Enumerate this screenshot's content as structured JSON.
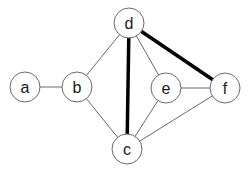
{
  "diagram": {
    "type": "undirected-graph",
    "node_radius": 15,
    "nodes": [
      {
        "id": "a",
        "label": "a",
        "x": 25,
        "y": 87
      },
      {
        "id": "b",
        "label": "b",
        "x": 77,
        "y": 87
      },
      {
        "id": "d",
        "label": "d",
        "x": 129,
        "y": 23
      },
      {
        "id": "c",
        "label": "c",
        "x": 127,
        "y": 149
      },
      {
        "id": "e",
        "label": "e",
        "x": 166,
        "y": 88
      },
      {
        "id": "f",
        "label": "f",
        "x": 225,
        "y": 88
      }
    ],
    "edges": [
      {
        "from": "a",
        "to": "b",
        "bold": false
      },
      {
        "from": "b",
        "to": "d",
        "bold": false
      },
      {
        "from": "b",
        "to": "c",
        "bold": false
      },
      {
        "from": "d",
        "to": "c",
        "bold": true
      },
      {
        "from": "d",
        "to": "e",
        "bold": false
      },
      {
        "from": "d",
        "to": "f",
        "bold": true
      },
      {
        "from": "e",
        "to": "f",
        "bold": false
      },
      {
        "from": "e",
        "to": "c",
        "bold": false
      },
      {
        "from": "f",
        "to": "c",
        "bold": false
      }
    ]
  }
}
